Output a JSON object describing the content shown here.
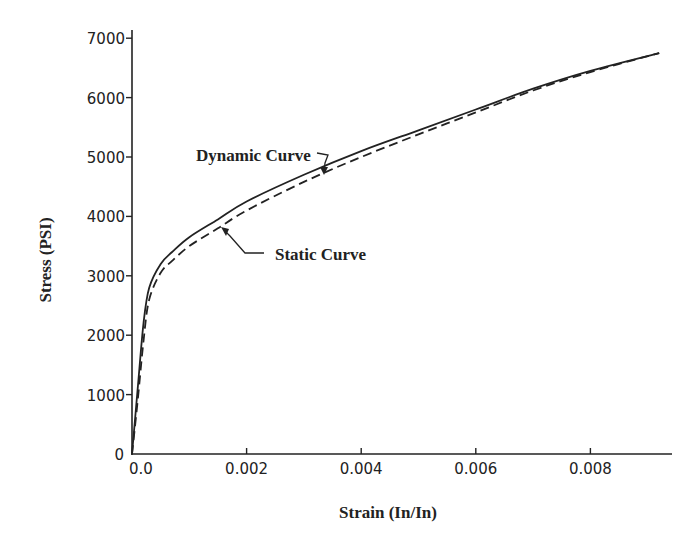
{
  "chart_data": {
    "type": "line",
    "title": "",
    "xlabel": "Strain (In/In)",
    "ylabel": "Stress (PSI)",
    "xlim": [
      0,
      0.0094
    ],
    "ylim": [
      0,
      7000
    ],
    "grid": false,
    "legend": "none (curves labelled by callout annotations)",
    "x_ticks": [
      0.0,
      0.002,
      0.004,
      0.006,
      0.008
    ],
    "x_tick_labels": [
      "0.0",
      "0.002",
      "0.004",
      "0.006",
      "0.008"
    ],
    "y_ticks": [
      0,
      1000,
      2000,
      3000,
      4000,
      5000,
      6000,
      7000
    ],
    "y_tick_labels": [
      "0",
      "1000",
      "2000",
      "3000",
      "4000",
      "5000",
      "6000",
      "7000"
    ],
    "series": [
      {
        "name": "Dynamic Curve",
        "style": "solid",
        "x": [
          0.0,
          0.0001,
          0.0002,
          0.0003,
          0.0005,
          0.0007,
          0.001,
          0.0015,
          0.002,
          0.003,
          0.004,
          0.005,
          0.006,
          0.007,
          0.008,
          0.0092
        ],
        "y": [
          0,
          1100,
          2200,
          2800,
          3200,
          3400,
          3650,
          3950,
          4250,
          4700,
          5100,
          5450,
          5800,
          6150,
          6450,
          6750
        ]
      },
      {
        "name": "Static Curve",
        "style": "dashed",
        "x": [
          0.0,
          0.0001,
          0.0002,
          0.0003,
          0.0005,
          0.0007,
          0.001,
          0.0015,
          0.002,
          0.003,
          0.004,
          0.005,
          0.006,
          0.007,
          0.008,
          0.0092
        ],
        "y": [
          0,
          900,
          1900,
          2600,
          3050,
          3250,
          3500,
          3800,
          4100,
          4580,
          5000,
          5380,
          5750,
          6120,
          6430,
          6750
        ]
      }
    ],
    "annotations": [
      {
        "text": "Dynamic Curve",
        "points_to": "Dynamic Curve",
        "near": [
          0.0031,
          4800
        ]
      },
      {
        "text": "Static Curve",
        "points_to": "Static Curve",
        "near": [
          0.0017,
          3750
        ]
      }
    ]
  },
  "labels": {
    "xlabel": "Strain (In/In)",
    "ylabel": "Stress (PSI)",
    "dynamic_annotation": "Dynamic Curve",
    "static_annotation": "Static Curve",
    "x_ticks": [
      "0.0",
      "0.002",
      "0.004",
      "0.006",
      "0.008"
    ],
    "y_ticks": [
      "0",
      "1000",
      "2000",
      "3000",
      "4000",
      "5000",
      "6000",
      "7000"
    ]
  },
  "colors": {
    "ink": "#222222",
    "background": "#ffffff"
  }
}
